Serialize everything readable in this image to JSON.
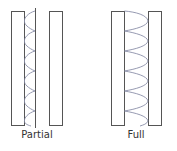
{
  "panels": [
    {
      "label": "Partial",
      "wave_extent": "partial"
    },
    {
      "label": "Full",
      "wave_extent": "full"
    }
  ],
  "colors": {
    "outline": "#555555",
    "wave": "#8a8fa8",
    "text": "#333333"
  }
}
